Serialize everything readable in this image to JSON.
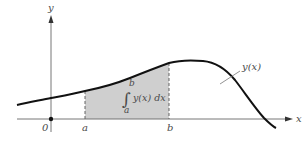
{
  "diagram": {
    "type": "definite-integral-area",
    "axes": {
      "x_label": "x",
      "y_label": "y",
      "origin_label": "0"
    },
    "curve": {
      "label": "y(x)"
    },
    "bounds": {
      "lower": "a",
      "upper": "b"
    },
    "integral": {
      "symbol": "∫",
      "lower_limit": "a",
      "upper_limit": "b",
      "integrand": "y(x) dx"
    },
    "colors": {
      "shading": "#c8c8c8",
      "curve": "#111111",
      "axis": "#555555",
      "text": "#4a4a4a"
    }
  }
}
